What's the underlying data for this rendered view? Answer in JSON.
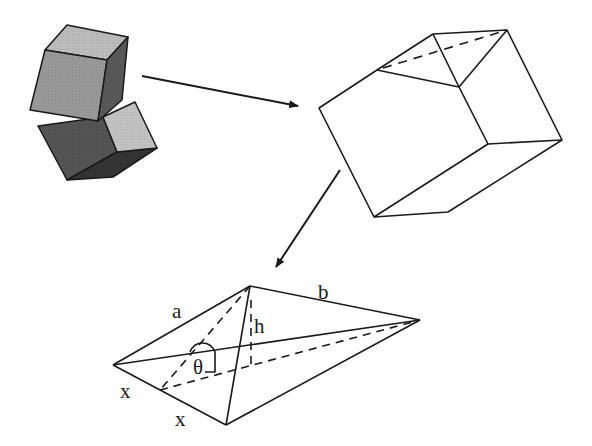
{
  "figure": {
    "panels": [
      {
        "id": "stacked-cubes",
        "label": "shaded cubes"
      },
      {
        "id": "cleaved-block",
        "label": "block with dashed cleavage plane"
      },
      {
        "id": "tetrahedron",
        "label": "tetrahedral fragment"
      }
    ],
    "labels": {
      "a": "a",
      "b": "b",
      "h": "h",
      "theta": "θ",
      "x1": "x",
      "x2": "x"
    },
    "colors": {
      "line": "#1a1a1a",
      "cube_light": "#b8b8b8",
      "cube_mid": "#8a8a8a",
      "cube_dark": "#4a4a4a",
      "cube_darker": "#3a3a3a",
      "background": "#ffffff"
    }
  }
}
